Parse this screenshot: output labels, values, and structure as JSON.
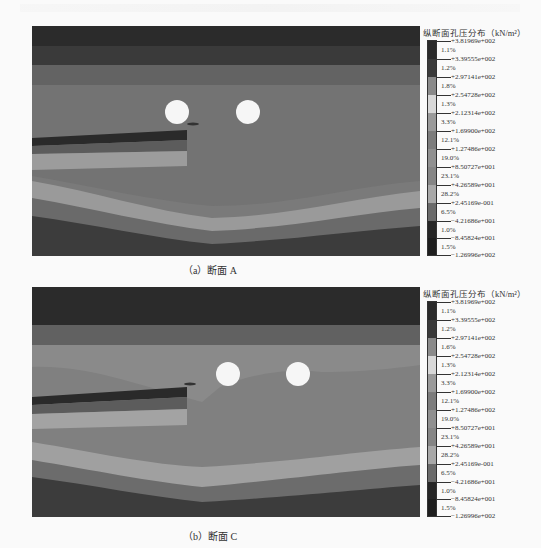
{
  "figure": {
    "panels": [
      {
        "caption": "（a）断面 A",
        "legend": {
          "title": "纵断面孔压分布（kN/m²）",
          "ticks": [
            "+3.81969e+002",
            "+3.39555e+002",
            "+2.97141e+002",
            "+2.54728e+002",
            "+2.12314e+002",
            "+1.69900e+002",
            "+1.27486e+002",
            "+8.50727e+001",
            "+4.26589e+001",
            "+2.45169e-001",
            "−4.21686e+001",
            "−8.45824e+001",
            "−1.26996e+002"
          ],
          "percentages": [
            "1.1%",
            "1.2%",
            "1.8%",
            "1.3%",
            "3.3%",
            "12.1%",
            "19.0%",
            "23.1%",
            "28.2%",
            "6.5%",
            "1.0%",
            "1.5%"
          ],
          "colors": [
            "#2a2a2a",
            "#3a3a3a",
            "#8a8a8a",
            "#d8d8d8",
            "#9a9a9a",
            "#7c7c7c",
            "#909090",
            "#858585",
            "#a8a8a8",
            "#6a6a6a",
            "#262626",
            "#1e1e1e"
          ]
        }
      },
      {
        "caption": "（b）断面 C",
        "legend": {
          "title": "纵断面孔压分布（kN/m²）",
          "ticks": [
            "+3.81969e+002",
            "+3.39555e+002",
            "+2.97141e+002",
            "+2.54728e+002",
            "+2.12314e+002",
            "+1.69900e+002",
            "+1.27486e+002",
            "+8.50727e+001",
            "+4.26589e+001",
            "+2.45169e-001",
            "−4.21686e+001",
            "−8.45824e+001",
            "−1.26996e+002"
          ],
          "percentages": [
            "1.1%",
            "1.2%",
            "1.6%",
            "1.3%",
            "3.3%",
            "12.1%",
            "19.0%",
            "23.1%",
            "28.2%",
            "6.5%",
            "1.0%",
            "1.5%"
          ],
          "colors": [
            "#2a2a2a",
            "#3a3a3a",
            "#8a8a8a",
            "#d8d8d8",
            "#9a9a9a",
            "#7c7c7c",
            "#909090",
            "#858585",
            "#a8a8a8",
            "#6a6a6a",
            "#262626",
            "#1e1e1e"
          ]
        }
      }
    ]
  }
}
